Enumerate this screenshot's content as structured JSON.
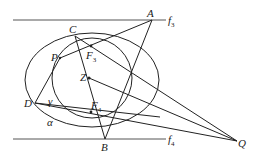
{
  "figure": {
    "labels": {
      "A": "A",
      "B": "B",
      "C": "C",
      "D": "D",
      "P": "P",
      "Q": "Q",
      "Z": "Z",
      "F3": "F",
      "F3_sub": "3",
      "F4": "F",
      "F4_sub": "4",
      "f3": "f",
      "f3_sub": "3",
      "f4": "f",
      "f4_sub": "4",
      "alpha": "α",
      "gamma": "γ"
    },
    "points": {
      "A": [
        152,
        20
      ],
      "B": [
        105,
        139
      ],
      "C": [
        75,
        36
      ],
      "D": [
        35,
        103
      ],
      "P": [
        60,
        58
      ],
      "Q": [
        237,
        141
      ],
      "Z": [
        89,
        78
      ],
      "F3": [
        91,
        46
      ],
      "F4": [
        91,
        112
      ]
    },
    "stroke_color": "#222222"
  }
}
